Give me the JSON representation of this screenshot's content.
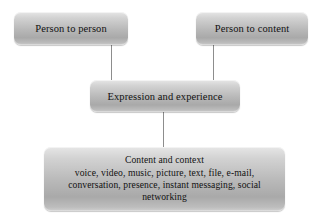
{
  "diagram": {
    "type": "hierarchy-tree",
    "background_color": "#ffffff",
    "node_fill_top": "#e6e6e6",
    "node_fill_bottom": "#a9a9a9",
    "connector_color": "#8d8d8d",
    "text_color": "#111111",
    "nodes": [
      {
        "id": "person-to-person",
        "label": "Person to person",
        "row": "top",
        "column": "left"
      },
      {
        "id": "person-to-content",
        "label": "Person to content",
        "row": "top",
        "column": "right"
      },
      {
        "id": "expression-and-experience",
        "label": "Expression and experience",
        "row": "middle",
        "column": "center"
      },
      {
        "id": "content-and-context",
        "heading": "Content and context",
        "detail_line_1": "voice, video, music, picture, text, file, e-mail,",
        "detail_line_2": "conversation, presence, instant messaging, social",
        "detail_line_3": "networking",
        "row": "bottom",
        "column": "center"
      }
    ],
    "connectors": [
      {
        "id": "connector-left",
        "from": "person-to-person",
        "to": "expression-and-experience"
      },
      {
        "id": "connector-right",
        "from": "person-to-content",
        "to": "expression-and-experience"
      },
      {
        "id": "connector-center",
        "from": "expression-and-experience",
        "to": "content-and-context"
      }
    ]
  }
}
